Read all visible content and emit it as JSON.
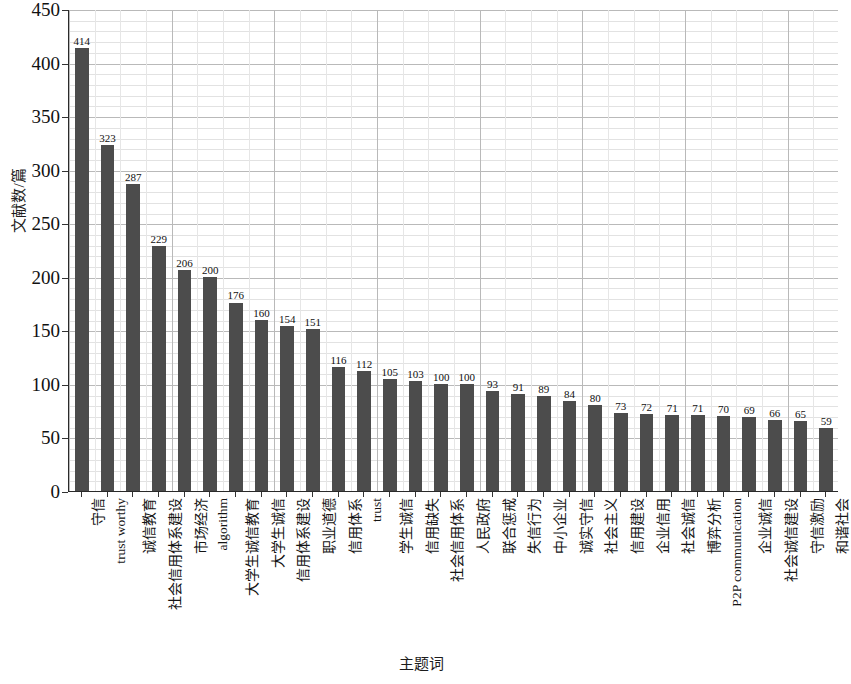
{
  "chart_data": {
    "type": "bar",
    "title": "",
    "xlabel": "主题词",
    "ylabel": "文献数/篇",
    "ylim": [
      0,
      450
    ],
    "ytick_step": 50,
    "yticks": [
      0,
      50,
      100,
      150,
      200,
      250,
      300,
      350,
      400,
      450
    ],
    "grid": true,
    "legend": null,
    "bar_color": "#4c4c4c",
    "categories": [
      "守信",
      "trust worthy",
      "诚信教育",
      "社会信用体系建设",
      "市场经济",
      "algorithm",
      "大学生诚信教育",
      "大学生诚信",
      "信用体系建设",
      "职业道德",
      "信用体系",
      "trust",
      "学生诚信",
      "信用缺失",
      "社会信用体系",
      "人民政府",
      "联合惩戒",
      "失信行为",
      "中小企业",
      "诚实守信",
      "社会主义",
      "信用建设",
      "企业信用",
      "社会诚信",
      "博弈分析",
      "P2P communication",
      "企业诚信",
      "社会诚信建设",
      "守信激励",
      "和谐社会"
    ],
    "values": [
      414,
      323,
      287,
      229,
      206,
      200,
      176,
      160,
      154,
      151,
      116,
      112,
      105,
      103,
      100,
      100,
      93,
      91,
      89,
      84,
      80,
      73,
      72,
      71,
      71,
      70,
      69,
      66,
      65,
      59
    ]
  },
  "axis": {
    "y_title": "文献数/篇",
    "x_title": "主题词"
  }
}
